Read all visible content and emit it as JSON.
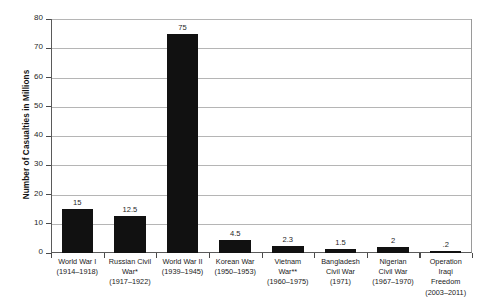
{
  "chart_data": {
    "type": "bar",
    "title": "",
    "xlabel": "",
    "ylabel": "Number of Casualties in Millions",
    "ylim": [
      0,
      80
    ],
    "ytick_step": 10,
    "yticks": [
      "80",
      "70",
      "60",
      "50",
      "40",
      "30",
      "20",
      "10",
      "0"
    ],
    "grid": true,
    "legend": "none",
    "bar_color": "#111111",
    "gridline_color": "#b5b5b5",
    "axis_color": "#5a5a5a",
    "categories": [
      "World War I (1914–1918)",
      "Russian Civil War* (1917–1922)",
      "World War II (1939–1945)",
      "Korean War (1950–1953)",
      "Vietnam War** (1960–1975)",
      "Bangladesh Civil War (1971)",
      "Nigerian Civil War (1967–1970)",
      "Operation Iraqi Freedom (2003–2011)"
    ],
    "values": [
      15,
      12.5,
      75,
      4.5,
      2.3,
      1.5,
      2,
      0.2
    ],
    "value_labels": [
      "15",
      "12.5",
      "75",
      "4.5",
      "2.3",
      "1.5",
      "2",
      ".2"
    ],
    "category_lines": [
      [
        "World War I",
        "(1914–1918)"
      ],
      [
        "Russian Civil",
        "War*",
        "(1917–1922)"
      ],
      [
        "World War II",
        "(1939–1945)"
      ],
      [
        "Korean War",
        "(1950–1953)"
      ],
      [
        "Vietnam",
        "War**",
        "(1960–1975)"
      ],
      [
        "Bangladesh",
        "Civil War",
        "(1971)"
      ],
      [
        "Nigerian",
        "Civil War",
        "(1967–1970)"
      ],
      [
        "Operation",
        "Iraqi",
        "Freedom",
        "(2003–2011)"
      ]
    ]
  }
}
